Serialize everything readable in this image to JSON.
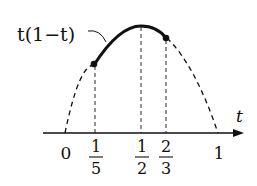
{
  "diagram": {
    "function_label": "t(1−t)",
    "axis_label": "t",
    "ticks": [
      {
        "value": 0,
        "num": "0",
        "den": null
      },
      {
        "value": 0.2,
        "num": "1",
        "den": "5"
      },
      {
        "value": 0.5,
        "num": "1",
        "den": "2"
      },
      {
        "value": 0.6667,
        "num": "2",
        "den": "3"
      },
      {
        "value": 1,
        "num": "1",
        "den": null
      }
    ],
    "highlight_interval": [
      0.2,
      0.6667
    ],
    "colors": {
      "ink": "#111111",
      "background": "#ffffff"
    }
  }
}
